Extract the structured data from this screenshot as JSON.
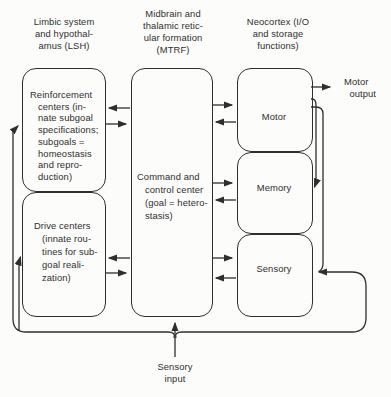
{
  "headers": {
    "lsh": "Limbic system\nand hypothal-\namus (LSH)",
    "mtrf": "Midbrain and\nthalamic retic-\nular formation\n(MTRF)",
    "neocortex": "Neocortex (I/O\nand storage\nfunctions)"
  },
  "boxes": {
    "reinforcement": "Reinforcement\ncenters (in-\nnate subgoal\nspecifications;\nsubgoals =\nhomeostasis\nand repro-\nduction)",
    "drive": "Drive centers\n(innate rou-\ntines for sub-\ngoal reali-\nzation)",
    "command": "Command and\ncontrol center\n(goal = hetero-\nstasis)",
    "motor": "Motor",
    "memory": "Memory",
    "sensory": "Sensory"
  },
  "labels": {
    "motor_output": "Motor\n  output",
    "sensory_input": "Sensory\ninput"
  },
  "colors": {
    "line": "#2e2e2e",
    "text": "#2e2e2e",
    "background": "#fcfcfa"
  }
}
